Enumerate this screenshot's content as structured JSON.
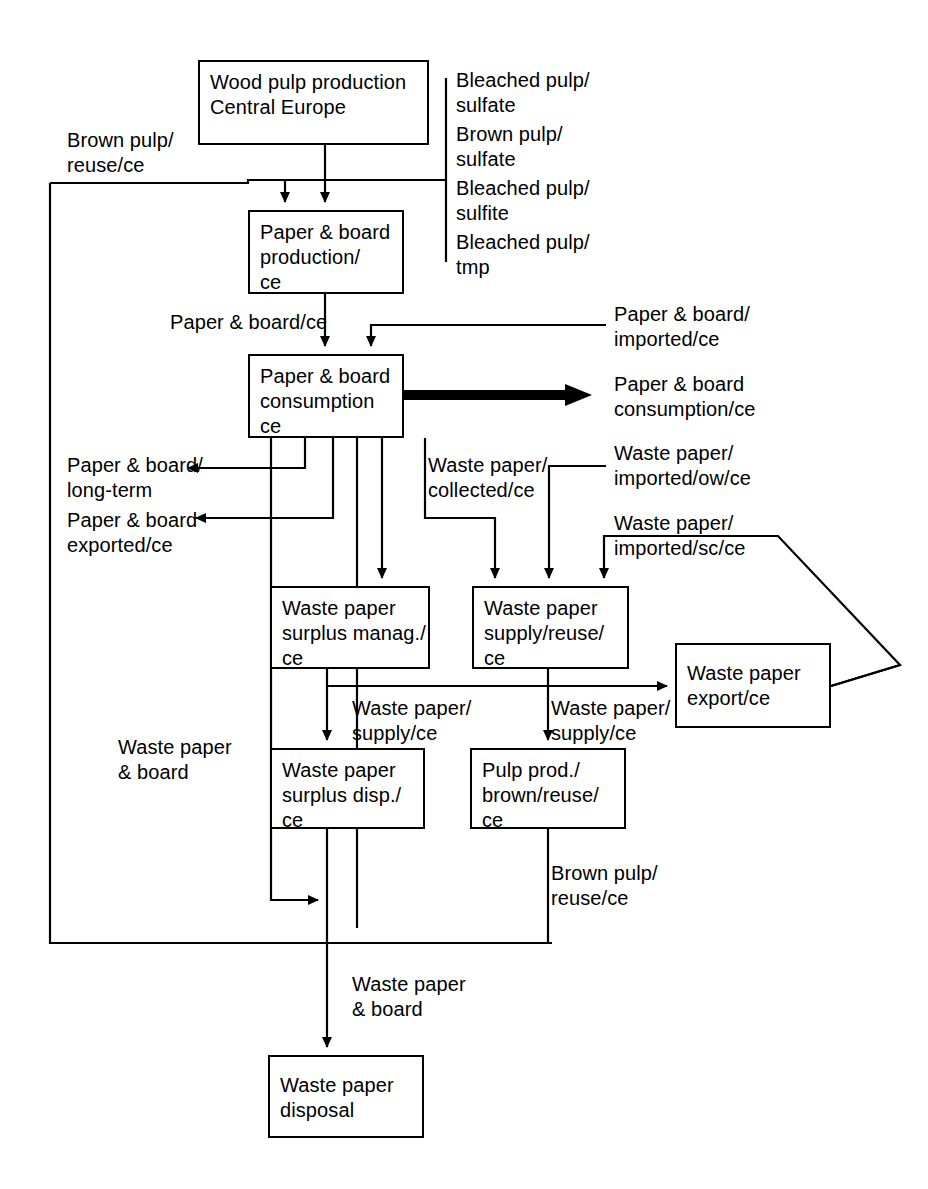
{
  "diagram": {
    "stroke_color": "#000000",
    "background_color": "#ffffff",
    "nodes": [
      {
        "id": "wood-pulp-production",
        "label": "Wood pulp production\nCentral Europe",
        "x": 198,
        "y": 60,
        "w": 231,
        "h": 85
      },
      {
        "id": "paper-board-production",
        "label": "Paper & board\nproduction/\nce",
        "x": 248,
        "y": 210,
        "w": 156,
        "h": 84
      },
      {
        "id": "paper-board-consumption",
        "label": "Paper & board\nconsumption\nce",
        "x": 248,
        "y": 354,
        "w": 156,
        "h": 84
      },
      {
        "id": "waste-paper-surplus-manag",
        "label": "Waste paper\nsurplus manag./\nce",
        "x": 270,
        "y": 586,
        "w": 160,
        "h": 83
      },
      {
        "id": "waste-paper-supply-reuse",
        "label": "Waste paper\nsupply/reuse/\nce",
        "x": 472,
        "y": 586,
        "w": 157,
        "h": 83
      },
      {
        "id": "waste-paper-export",
        "label": "Waste paper\nexport/ce",
        "x": 675,
        "y": 643,
        "w": 156,
        "h": 85
      },
      {
        "id": "waste-paper-surplus-disp",
        "label": "Waste paper\nsurplus disp./\nce",
        "x": 270,
        "y": 748,
        "w": 155,
        "h": 81
      },
      {
        "id": "pulp-prod-brown-reuse",
        "label": "Pulp prod./\nbrown/reuse/\nce",
        "x": 470,
        "y": 748,
        "w": 156,
        "h": 81
      },
      {
        "id": "waste-paper-disposal",
        "label": "Waste paper\ndisposal",
        "x": 268,
        "y": 1055,
        "w": 156,
        "h": 83
      }
    ],
    "flow_labels": [
      {
        "id": "bleached-pulp-sulfate",
        "text": "Bleached pulp/\nsulfate",
        "x": 456,
        "y": 68
      },
      {
        "id": "brown-pulp-sulfate",
        "text": "Brown pulp/\nsulfate",
        "x": 456,
        "y": 122
      },
      {
        "id": "bleached-pulp-sulfite",
        "text": "Bleached pulp/\nsulfite",
        "x": 456,
        "y": 176
      },
      {
        "id": "bleached-pulp-tmp",
        "text": "Bleached pulp/\ntmp",
        "x": 456,
        "y": 230
      },
      {
        "id": "brown-pulp-reuse-ce",
        "text": "Brown pulp/\nreuse/ce",
        "x": 67,
        "y": 128
      },
      {
        "id": "paper-board-ce",
        "text": "Paper & board/ce",
        "x": 170,
        "y": 310
      },
      {
        "id": "paper-board-imported-ce",
        "text": "Paper & board/\nimported/ce",
        "x": 614,
        "y": 302
      },
      {
        "id": "paper-board-consumption-ce",
        "text": "Paper & board\nconsumption/ce",
        "x": 614,
        "y": 372
      },
      {
        "id": "paper-board-long-term",
        "text": "Paper & board/\nlong-term",
        "x": 67,
        "y": 453
      },
      {
        "id": "paper-board-exported-ce",
        "text": "Paper & board\nexported/ce",
        "x": 67,
        "y": 508
      },
      {
        "id": "waste-paper-collected-ce",
        "text": "Waste paper/\ncollected/ce",
        "x": 428,
        "y": 453
      },
      {
        "id": "waste-paper-imported-ow-ce",
        "text": "Waste paper/\nimported/ow/ce",
        "x": 614,
        "y": 441
      },
      {
        "id": "waste-paper-imported-sc-ce",
        "text": "Waste paper/\nimported/sc/ce",
        "x": 614,
        "y": 511
      },
      {
        "id": "waste-paper-supply-ce-left",
        "text": "Waste paper/\nsupply/ce",
        "x": 352,
        "y": 696
      },
      {
        "id": "waste-paper-supply-ce-right",
        "text": "Waste paper/\nsupply/ce",
        "x": 551,
        "y": 696
      },
      {
        "id": "waste-paper-board-left",
        "text": "Waste paper\n& board",
        "x": 118,
        "y": 735
      },
      {
        "id": "brown-pulp-reuse-ce-2",
        "text": "Brown pulp/\nreuse/ce",
        "x": 551,
        "y": 861
      },
      {
        "id": "waste-paper-board-bottom",
        "text": "Waste paper\n& board",
        "x": 352,
        "y": 972
      }
    ],
    "connectors": {
      "thick_arrow": {
        "id": "paper-board-consumption-output",
        "from_x": 403,
        "to_x": 592,
        "y": 395,
        "thickness": 11
      }
    }
  }
}
